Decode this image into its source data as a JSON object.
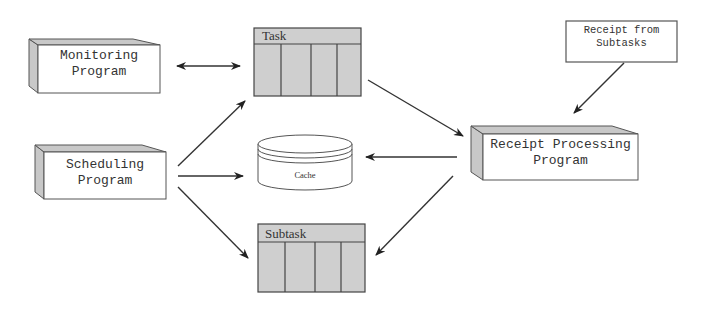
{
  "diagram": {
    "nodes": {
      "monitoring": {
        "line1": "Monitoring",
        "line2": "Program"
      },
      "scheduling": {
        "line1": "Scheduling",
        "line2": "Program"
      },
      "task": {
        "label": "Task"
      },
      "cache": {
        "label": "Cache"
      },
      "subtask": {
        "label": "Subtask"
      },
      "receipt_processing": {
        "line1": "Receipt Processing",
        "line2": "Program"
      },
      "receipt_from_subtasks": {
        "line1": "Receipt from",
        "line2": "Subtasks"
      }
    },
    "edges": [
      {
        "from": "monitoring",
        "to": "task",
        "type": "bidirectional"
      },
      {
        "from": "scheduling",
        "to": "task",
        "type": "directed"
      },
      {
        "from": "scheduling",
        "to": "cache",
        "type": "directed"
      },
      {
        "from": "scheduling",
        "to": "subtask",
        "type": "directed"
      },
      {
        "from": "task",
        "to": "receipt_processing",
        "type": "directed"
      },
      {
        "from": "receipt_processing",
        "to": "cache",
        "type": "directed"
      },
      {
        "from": "receipt_processing",
        "to": "subtask",
        "type": "directed"
      },
      {
        "from": "receipt_from_subtasks",
        "to": "receipt_processing",
        "type": "directed"
      }
    ],
    "colors": {
      "box_fill": "#ffffff",
      "bevel": "#c8c8c8",
      "table_fill": "#cfcfcf",
      "stroke": "#444444"
    }
  }
}
